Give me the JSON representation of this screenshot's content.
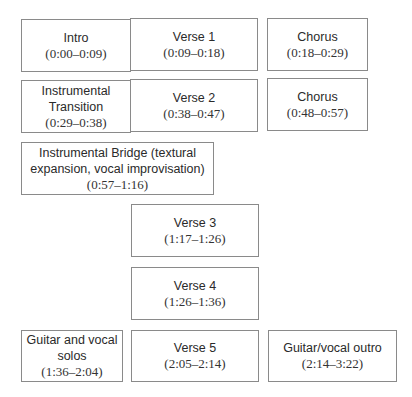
{
  "diagram": {
    "sections": [
      {
        "label": "Intro",
        "time": "(0:00–0:09)"
      },
      {
        "label": "Verse 1",
        "time": "(0:09–0:18)"
      },
      {
        "label": "Chorus",
        "time": "(0:18–0:29)"
      },
      {
        "label_lines": [
          "Instrumental",
          "Transition"
        ],
        "time": "(0:29–0:38)"
      },
      {
        "label": "Verse 2",
        "time": "(0:38–0:47)"
      },
      {
        "label": "Chorus",
        "time": "(0:48–0:57)"
      },
      {
        "label_lines": [
          "Instrumental Bridge (textural",
          "expansion, vocal improvisation)"
        ],
        "time": "(0:57–1:16)"
      },
      {
        "label": "Verse 3",
        "time": "(1:17–1:26)"
      },
      {
        "label": "Verse 4",
        "time": "(1:26–1:36)"
      },
      {
        "label_lines": [
          "Guitar and vocal",
          "solos"
        ],
        "time": "(1:36–2:04)"
      },
      {
        "label": "Verse 5",
        "time": "(2:05–2:14)"
      },
      {
        "label": "Guitar/vocal outro",
        "time": "(2:14–3:22)"
      }
    ]
  }
}
